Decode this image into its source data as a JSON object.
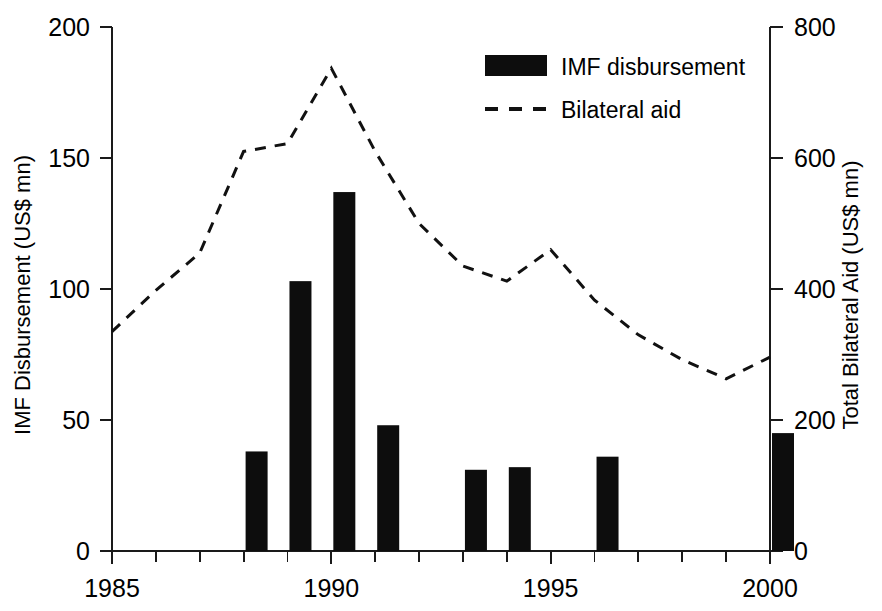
{
  "chart_data": {
    "type": "bar",
    "title": "",
    "xlabel": "",
    "ylabel": "IMF Disbursement (US$ mn)",
    "y2label": "Total Bilateral Aid (US$ mn)",
    "xlim": [
      1985,
      2000
    ],
    "ylim": [
      0,
      200
    ],
    "y2lim": [
      0,
      800
    ],
    "grid": false,
    "legend_position": "top-right",
    "x_ticks": [
      1985,
      1986,
      1987,
      1988,
      1989,
      1990,
      1991,
      1992,
      1993,
      1994,
      1995,
      1996,
      1997,
      1998,
      1999,
      2000
    ],
    "x_tick_labels": [
      "1985",
      "",
      "",
      "",
      "",
      "1990",
      "",
      "",
      "",
      "",
      "1995",
      "",
      "",
      "",
      "",
      "2000"
    ],
    "y_ticks": [
      0,
      50,
      100,
      150,
      200
    ],
    "y_tick_labels": [
      "0",
      "50",
      "100",
      "150",
      "200"
    ],
    "y2_ticks": [
      0,
      200,
      400,
      600,
      800
    ],
    "y2_tick_labels": [
      "0",
      "200",
      "400",
      "600",
      "800"
    ],
    "series": [
      {
        "name": "IMF disbursement",
        "type": "bar",
        "axis": "left",
        "color": "#0d0d0d",
        "x": [
          1985,
          1986,
          1987,
          1988,
          1989,
          1990,
          1991,
          1992,
          1993,
          1994,
          1995,
          1996,
          1997,
          1998,
          1999,
          2000
        ],
        "values": [
          0,
          0,
          0,
          38,
          103,
          137,
          48,
          0,
          31,
          32,
          0,
          36,
          0,
          0,
          0,
          45
        ]
      },
      {
        "name": "Bilateral aid",
        "type": "line",
        "style": "dashed",
        "axis": "right",
        "color": "#111111",
        "x": [
          1985,
          1986,
          1987,
          1988,
          1989,
          1990,
          1991,
          1992,
          1993,
          1994,
          1995,
          1996,
          1997,
          1998,
          1999,
          2000
        ],
        "values": [
          335,
          398,
          455,
          610,
          622,
          737,
          610,
          500,
          435,
          412,
          460,
          383,
          330,
          292,
          263,
          296
        ]
      }
    ],
    "legend": [
      {
        "label": "IMF disbursement",
        "marker": "filled-rect",
        "color": "#0d0d0d"
      },
      {
        "label": "Bilateral aid",
        "marker": "dashed-line",
        "color": "#111111"
      }
    ]
  },
  "axes": {
    "left_title": "IMF Disbursement (US$ mn)",
    "right_title": "Total Bilateral Aid (US$ mn)"
  },
  "legend": {
    "imf_label": "IMF disbursement",
    "aid_label": "Bilateral aid"
  }
}
